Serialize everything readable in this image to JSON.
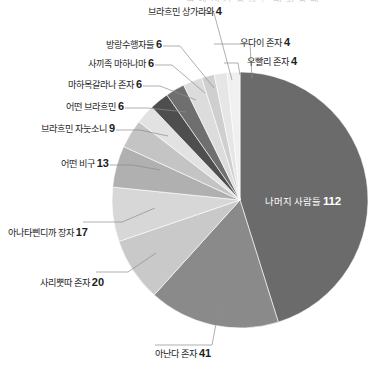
{
  "chart_data": {
    "type": "pie",
    "title": "",
    "title_clipped": "국 에 서 가 장 많 은 대 화 상 대",
    "total": 248,
    "start_angle_deg": 0,
    "direction": "clockwise",
    "legend": "none",
    "labels_position": "outside-callout",
    "categories": [
      "나머지 사람들",
      "아난다 존자",
      "사리뿟따 존자",
      "아나타삔디까 장자",
      "어떤 비구",
      "브라흐민 자눗소니",
      "어떤 브라흐민",
      "마하목갈라나 존자",
      "사끼족 마하나마",
      "방랑수행자들",
      "브라흐민 상가라와",
      "우다이 존자",
      "우빨리 존자"
    ],
    "values": [
      112,
      41,
      20,
      17,
      13,
      9,
      6,
      6,
      6,
      6,
      4,
      4,
      4
    ],
    "colors": [
      "#6b6b6b",
      "#8a8a8a",
      "#c9c9c9",
      "#d7d7d7",
      "#b0b0b0",
      "#c4c4c4",
      "#e2e2e2",
      "#4e4e4e",
      "#6f6f6f",
      "#dcdcdc",
      "#cfcfcf",
      "#e6e6e6",
      "#f0f0f0"
    ],
    "slices": [
      {
        "label": "나머지 사람들",
        "value": 112,
        "color": "#6b6b6b",
        "label_placement": "inside",
        "label_color": "#ffffff"
      },
      {
        "label": "아난다 존자",
        "value": 41,
        "color": "#8a8a8a",
        "label_placement": "bottom"
      },
      {
        "label": "사리뿟따 존자",
        "value": 20,
        "color": "#c9c9c9",
        "label_placement": "left"
      },
      {
        "label": "아나타삔디까 장자",
        "value": 17,
        "color": "#d7d7d7",
        "label_placement": "left"
      },
      {
        "label": "어떤 비구",
        "value": 13,
        "color": "#b0b0b0",
        "label_placement": "left"
      },
      {
        "label": "브라흐민 자눗소니",
        "value": 9,
        "color": "#c4c4c4",
        "label_placement": "left"
      },
      {
        "label": "어떤 브라흐민",
        "value": 6,
        "color": "#e2e2e2",
        "label_placement": "left"
      },
      {
        "label": "마하목갈라나 존자",
        "value": 6,
        "color": "#4e4e4e",
        "label_placement": "left"
      },
      {
        "label": "사끼족 마하나마",
        "value": 6,
        "color": "#6f6f6f",
        "label_placement": "left"
      },
      {
        "label": "방랑수행자들",
        "value": 6,
        "color": "#dcdcdc",
        "label_placement": "left"
      },
      {
        "label": "브라흐민 상가라와",
        "value": 4,
        "color": "#cfcfcf",
        "label_placement": "top"
      },
      {
        "label": "우다이 존자",
        "value": 4,
        "color": "#e6e6e6",
        "label_placement": "top-right"
      },
      {
        "label": "우빨리 존자",
        "value": 4,
        "color": "#f0f0f0",
        "label_placement": "top-right"
      }
    ]
  },
  "callouts": [
    {
      "id": "sangarava",
      "label": "브라흐민 상가라와",
      "value": "4"
    },
    {
      "id": "udayi",
      "label": "우다이 존자",
      "value": "4"
    },
    {
      "id": "upali",
      "label": "우빨리 존자",
      "value": "4"
    },
    {
      "id": "wanderers",
      "label": "방랑수행자들",
      "value": "6"
    },
    {
      "id": "mahanama",
      "label": "사끼족 마하나마",
      "value": "6"
    },
    {
      "id": "moggallana",
      "label": "마하목갈라나 존자",
      "value": "6"
    },
    {
      "id": "brahmin",
      "label": "어떤 브라흐민",
      "value": "6"
    },
    {
      "id": "janussoni",
      "label": "브라흐민 자눗소니",
      "value": "9"
    },
    {
      "id": "bhikkhu",
      "label": "어떤 비구",
      "value": "13"
    },
    {
      "id": "anathapindika",
      "label": "아나타삔디까 장자",
      "value": "17"
    },
    {
      "id": "sariputta",
      "label": "사리뿟따 존자",
      "value": "20"
    },
    {
      "id": "ananda",
      "label": "아난다 존자",
      "value": "41"
    }
  ],
  "inner_label": {
    "label": "나머지 사람들",
    "value": "112"
  }
}
